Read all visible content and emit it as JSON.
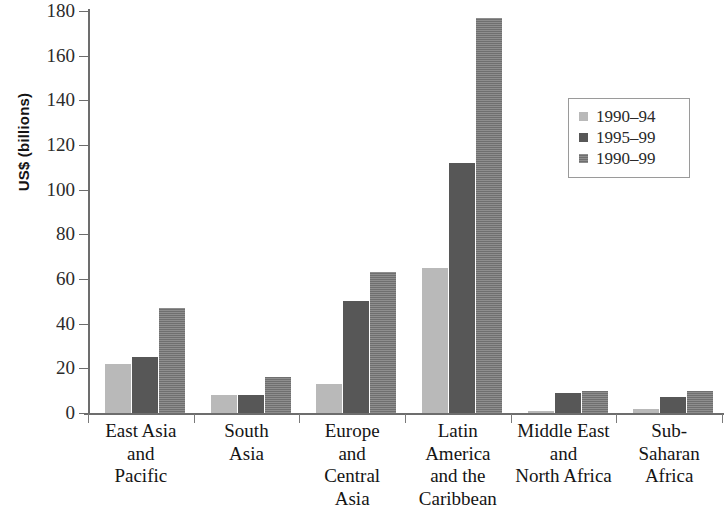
{
  "chart_data": {
    "type": "bar",
    "title": "",
    "xlabel": "",
    "ylabel": "US$ (billions)",
    "ylim": [
      0,
      180
    ],
    "yticks": [
      0,
      20,
      40,
      60,
      80,
      100,
      120,
      140,
      160,
      180
    ],
    "grid": false,
    "legend_position": "upper right",
    "categories": [
      "East Asia and Pacific",
      "South Asia",
      "Europe and Central Asia",
      "Latin America and the Caribbean",
      "Middle East and North Africa",
      "Sub-Saharan Africa"
    ],
    "category_lines": [
      [
        "East Asia",
        "and",
        "Pacific"
      ],
      [
        "South",
        "Asia"
      ],
      [
        "Europe",
        "and",
        "Central",
        "Asia"
      ],
      [
        "Latin",
        "America",
        "and the",
        "Caribbean"
      ],
      [
        "Middle East",
        "and",
        "North Africa"
      ],
      [
        "Sub-",
        "Saharan",
        "Africa"
      ]
    ],
    "series": [
      {
        "name": "1990-94",
        "color": "#b9b9b9",
        "values": [
          22,
          8,
          13,
          65,
          1,
          2
        ]
      },
      {
        "name": "1995-99",
        "color": "#575757",
        "values": [
          25,
          8,
          50,
          112,
          9,
          7
        ]
      },
      {
        "name": "1990-99",
        "color": "#8e8e8e",
        "values": [
          47,
          16,
          63,
          177,
          10,
          10
        ]
      }
    ]
  },
  "legend": {
    "entries": [
      {
        "label": "1990–94"
      },
      {
        "label": "1995–99"
      },
      {
        "label": "1990–99"
      }
    ]
  },
  "axis": {
    "y_title": "US$ (billions)",
    "tick_labels": [
      "0",
      "20",
      "40",
      "60",
      "80",
      "100",
      "120",
      "140",
      "160",
      "180"
    ]
  }
}
